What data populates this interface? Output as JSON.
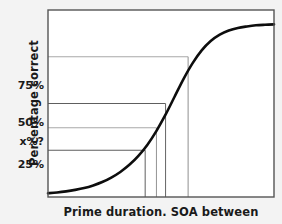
{
  "chart_data": {
    "type": "line",
    "title": "",
    "subtitle": "",
    "xlabel": "Prime duration. SOA between",
    "ylabel": "Percentage correct",
    "grid": true,
    "legend": null,
    "xlim": [
      0,
      100
    ],
    "ylim": [
      0,
      100
    ],
    "y_tick_labels": [
      "75%",
      "50%",
      "x%?",
      "25%"
    ],
    "y_tick_values": [
      75,
      50,
      37,
      25
    ],
    "x_tick_labels": [],
    "reference_lines": [
      {
        "label": "75%",
        "y_value": 75,
        "x_value": 62,
        "style": "light-gray"
      },
      {
        "label": "50%",
        "y_value": 50,
        "x_value": 52,
        "style": "dark-gray"
      },
      {
        "label": "x%?",
        "y_value": 37,
        "x_value": 48,
        "style": "light-gray"
      },
      {
        "label": "25%",
        "y_value": 25,
        "x_value": 43,
        "style": "dark-gray"
      }
    ],
    "series": [
      {
        "name": "Psychometric function",
        "color": "#0d0d0d",
        "x": [
          0,
          4,
          8,
          12,
          16,
          20,
          24,
          28,
          32,
          36,
          40,
          44,
          48,
          52,
          56,
          60,
          64,
          68,
          72,
          76,
          80,
          84,
          88,
          92,
          96,
          100
        ],
        "values": [
          2.0,
          2.4,
          3.0,
          3.8,
          4.8,
          6.2,
          8.0,
          10.4,
          13.4,
          17.2,
          22.0,
          28.0,
          35.4,
          44.0,
          53.6,
          63.2,
          71.6,
          78.4,
          83.4,
          86.8,
          89.0,
          90.4,
          91.2,
          91.8,
          92.1,
          92.3
        ]
      }
    ]
  },
  "colors": {
    "page_background": "#f3f3f3",
    "plot_background": "#ffffff",
    "axis_frame": "#555555",
    "curve": "#0d0d0d",
    "gridline_dark": "#666666",
    "gridline_light": "#a8a8a8",
    "dropline": "#777777",
    "text": "#1a1a1a"
  }
}
